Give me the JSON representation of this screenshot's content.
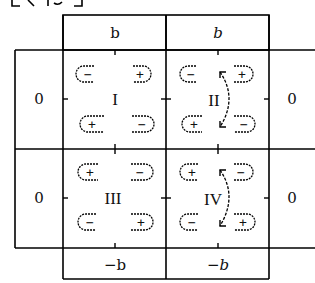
{
  "title_fragment": "[ ⁣⁣ ]",
  "columns": {
    "top": [
      "b",
      "b"
    ],
    "bottom": [
      "−b",
      "−b"
    ]
  },
  "rows": {
    "left": [
      "0",
      "0"
    ],
    "right": [
      "0",
      "0"
    ]
  },
  "quadrants": [
    {
      "id": "I",
      "top_left": "−",
      "top_right": "+",
      "bottom_left": "+",
      "bottom_right": "−",
      "arrow": false
    },
    {
      "id": "II",
      "top_left": "−",
      "top_right": "+",
      "bottom_left": "+",
      "bottom_right": "−",
      "arrow": true
    },
    {
      "id": "III",
      "top_left": "+",
      "top_right": "−",
      "bottom_left": "−",
      "bottom_right": "+",
      "arrow": false
    },
    {
      "id": "IV",
      "top_left": "+",
      "top_right": "−",
      "bottom_left": "−",
      "bottom_right": "+",
      "arrow": true
    }
  ]
}
